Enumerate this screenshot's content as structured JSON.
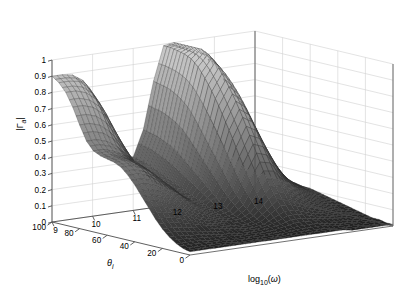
{
  "figure": {
    "type": "3d-surface-mesh",
    "background": "#ffffff",
    "render_style": "grayscale-mesh",
    "colormap": "gray"
  },
  "axes": {
    "vertical": {
      "name": "reflection-coefficient-magnitude",
      "label_main": "|Γ",
      "label_sub": "a",
      "label_tail": "|",
      "label_plain": "|Γa|",
      "min": 0,
      "max": 1,
      "step": 0.1,
      "ticks": [
        "1",
        "0.9",
        "0.8",
        "0.7",
        "0.6",
        "0.5",
        "0.4",
        "0.3",
        "0.2",
        "0.1",
        "0"
      ]
    },
    "depth_left": {
      "name": "incidence-angle",
      "label_main": "θ",
      "label_sub": "i",
      "label_plain": "θi",
      "min": 0,
      "max": 100,
      "step": 20,
      "ticks": [
        "100",
        "80",
        "60",
        "40",
        "20",
        "0"
      ]
    },
    "depth_right": {
      "name": "log-omega",
      "label_main": "log",
      "label_sub": "10",
      "label_tail": "(ω)",
      "label_plain": "log10(ω)",
      "min": 9,
      "max": 14,
      "step": 1,
      "ticks": [
        "9",
        "10",
        "11",
        "12",
        "13",
        "14"
      ]
    }
  },
  "colors": {
    "axis_line": "#4d4d4d",
    "grid_line": "#d0d0d0",
    "tick_text": "#000000",
    "mesh_dark": "#1a1a1a",
    "mesh_mid": "#6e6e6e",
    "mesh_light": "#b8b8b8",
    "mesh_edge": "#2a2a2a",
    "wall": "#ffffff"
  },
  "chart_data": {
    "type": "surface",
    "title": "",
    "xlabel": "log10(ω)",
    "ylabel": "θi",
    "zlabel": "|Γa|",
    "xlim": [
      9,
      14
    ],
    "ylim": [
      0,
      100
    ],
    "zlim": [
      0,
      1
    ],
    "grid": true,
    "legend": "none",
    "x": [
      9.0,
      9.25,
      9.5,
      9.75,
      10.0,
      10.25,
      10.5,
      10.75,
      11.0,
      11.25,
      11.5,
      11.75,
      12.0,
      12.25,
      12.5,
      12.75,
      13.0,
      13.25,
      13.5,
      13.75,
      14.0
    ],
    "y": [
      0,
      5,
      10,
      15,
      20,
      25,
      30,
      35,
      40,
      45,
      50,
      55,
      60,
      65,
      70,
      75,
      80,
      85,
      90,
      95,
      100
    ],
    "features": [
      {
        "name": "left-ridge-crest",
        "theta": 100,
        "log10w": 9.0,
        "value": 0.9
      },
      {
        "name": "left-ridge-shoulder",
        "theta": 80,
        "log10w": 9.0,
        "value": 0.84
      },
      {
        "name": "left-ridge-midslope",
        "theta": 60,
        "log10w": 9.0,
        "value": 0.45
      },
      {
        "name": "valley-minimum",
        "theta": 40,
        "log10w": 11.0,
        "value": 0.02
      },
      {
        "name": "right-peak-apex",
        "theta": 100,
        "log10w": 12.2,
        "value": 1.0
      },
      {
        "name": "right-peak-midslope",
        "theta": 60,
        "log10w": 12.2,
        "value": 0.55
      },
      {
        "name": "far-tail",
        "theta": 0,
        "log10w": 14.0,
        "value": 0.01
      },
      {
        "name": "high-freq-edge",
        "theta": 100,
        "log10w": 14.0,
        "value": 0.12
      }
    ],
    "surface_z": [
      [
        0.02,
        0.02,
        0.02,
        0.02,
        0.02,
        0.02,
        0.02,
        0.02,
        0.02,
        0.02,
        0.02,
        0.02,
        0.02,
        0.02,
        0.02,
        0.02,
        0.01,
        0.01,
        0.01,
        0.01,
        0.01
      ],
      [
        0.03,
        0.03,
        0.03,
        0.03,
        0.03,
        0.02,
        0.02,
        0.02,
        0.02,
        0.02,
        0.02,
        0.03,
        0.03,
        0.03,
        0.03,
        0.02,
        0.02,
        0.02,
        0.01,
        0.01,
        0.01
      ],
      [
        0.05,
        0.05,
        0.05,
        0.04,
        0.04,
        0.04,
        0.03,
        0.03,
        0.03,
        0.03,
        0.03,
        0.04,
        0.05,
        0.05,
        0.05,
        0.04,
        0.03,
        0.03,
        0.02,
        0.02,
        0.02
      ],
      [
        0.08,
        0.08,
        0.07,
        0.07,
        0.06,
        0.05,
        0.05,
        0.04,
        0.04,
        0.04,
        0.05,
        0.06,
        0.08,
        0.08,
        0.07,
        0.06,
        0.05,
        0.04,
        0.03,
        0.03,
        0.02
      ],
      [
        0.12,
        0.12,
        0.11,
        0.1,
        0.09,
        0.08,
        0.07,
        0.06,
        0.05,
        0.05,
        0.06,
        0.09,
        0.12,
        0.12,
        0.1,
        0.08,
        0.07,
        0.05,
        0.04,
        0.04,
        0.03
      ],
      [
        0.17,
        0.17,
        0.16,
        0.14,
        0.12,
        0.1,
        0.09,
        0.07,
        0.06,
        0.06,
        0.08,
        0.13,
        0.18,
        0.18,
        0.15,
        0.11,
        0.09,
        0.07,
        0.05,
        0.04,
        0.04
      ],
      [
        0.23,
        0.23,
        0.21,
        0.19,
        0.16,
        0.13,
        0.11,
        0.09,
        0.08,
        0.08,
        0.11,
        0.18,
        0.25,
        0.25,
        0.2,
        0.15,
        0.11,
        0.09,
        0.07,
        0.05,
        0.05
      ],
      [
        0.29,
        0.29,
        0.27,
        0.24,
        0.2,
        0.17,
        0.14,
        0.11,
        0.09,
        0.1,
        0.15,
        0.25,
        0.34,
        0.33,
        0.26,
        0.19,
        0.14,
        0.11,
        0.08,
        0.07,
        0.06
      ],
      [
        0.35,
        0.35,
        0.33,
        0.29,
        0.25,
        0.21,
        0.17,
        0.13,
        0.11,
        0.13,
        0.2,
        0.33,
        0.44,
        0.42,
        0.33,
        0.24,
        0.18,
        0.13,
        0.1,
        0.08,
        0.07
      ],
      [
        0.4,
        0.4,
        0.38,
        0.34,
        0.29,
        0.24,
        0.19,
        0.15,
        0.13,
        0.16,
        0.26,
        0.42,
        0.54,
        0.51,
        0.4,
        0.29,
        0.21,
        0.16,
        0.12,
        0.09,
        0.08
      ],
      [
        0.44,
        0.44,
        0.42,
        0.38,
        0.32,
        0.27,
        0.21,
        0.17,
        0.15,
        0.2,
        0.33,
        0.52,
        0.64,
        0.6,
        0.47,
        0.34,
        0.25,
        0.18,
        0.14,
        0.11,
        0.09
      ],
      [
        0.46,
        0.46,
        0.44,
        0.4,
        0.35,
        0.29,
        0.23,
        0.18,
        0.17,
        0.24,
        0.4,
        0.61,
        0.73,
        0.68,
        0.54,
        0.39,
        0.28,
        0.21,
        0.16,
        0.12,
        0.1
      ],
      [
        0.47,
        0.47,
        0.45,
        0.42,
        0.36,
        0.3,
        0.24,
        0.2,
        0.19,
        0.28,
        0.47,
        0.7,
        0.81,
        0.75,
        0.6,
        0.44,
        0.32,
        0.23,
        0.17,
        0.13,
        0.11
      ],
      [
        0.48,
        0.48,
        0.46,
        0.43,
        0.38,
        0.31,
        0.25,
        0.21,
        0.21,
        0.32,
        0.54,
        0.78,
        0.88,
        0.81,
        0.65,
        0.48,
        0.35,
        0.25,
        0.19,
        0.14,
        0.11
      ],
      [
        0.5,
        0.5,
        0.48,
        0.45,
        0.39,
        0.33,
        0.26,
        0.22,
        0.23,
        0.36,
        0.61,
        0.85,
        0.94,
        0.86,
        0.7,
        0.51,
        0.37,
        0.27,
        0.2,
        0.15,
        0.12
      ],
      [
        0.55,
        0.55,
        0.53,
        0.49,
        0.43,
        0.35,
        0.28,
        0.24,
        0.25,
        0.4,
        0.67,
        0.91,
        0.98,
        0.9,
        0.73,
        0.54,
        0.39,
        0.28,
        0.21,
        0.16,
        0.12
      ],
      [
        0.64,
        0.64,
        0.62,
        0.57,
        0.49,
        0.4,
        0.31,
        0.26,
        0.27,
        0.43,
        0.71,
        0.95,
        1.0,
        0.92,
        0.75,
        0.56,
        0.4,
        0.29,
        0.22,
        0.16,
        0.12
      ],
      [
        0.74,
        0.74,
        0.72,
        0.67,
        0.57,
        0.46,
        0.35,
        0.28,
        0.29,
        0.45,
        0.74,
        0.97,
        1.0,
        0.93,
        0.76,
        0.57,
        0.41,
        0.3,
        0.22,
        0.17,
        0.13
      ],
      [
        0.82,
        0.82,
        0.8,
        0.75,
        0.65,
        0.52,
        0.39,
        0.31,
        0.31,
        0.47,
        0.76,
        0.98,
        1.0,
        0.93,
        0.77,
        0.57,
        0.41,
        0.3,
        0.22,
        0.17,
        0.13
      ],
      [
        0.87,
        0.87,
        0.86,
        0.81,
        0.71,
        0.57,
        0.43,
        0.33,
        0.32,
        0.48,
        0.77,
        0.99,
        1.0,
        0.94,
        0.77,
        0.58,
        0.42,
        0.3,
        0.23,
        0.17,
        0.13
      ],
      [
        0.9,
        0.9,
        0.89,
        0.85,
        0.75,
        0.61,
        0.46,
        0.35,
        0.33,
        0.49,
        0.78,
        0.99,
        1.0,
        0.94,
        0.77,
        0.58,
        0.42,
        0.31,
        0.23,
        0.17,
        0.13
      ]
    ]
  }
}
